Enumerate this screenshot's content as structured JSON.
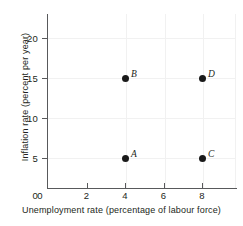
{
  "chart_data": {
    "type": "scatter",
    "title": "",
    "xlabel": "Unemployment rate (percentage of labour force)",
    "ylabel": "Inflation rate (percent per year)",
    "xlim": [
      0,
      9.8
    ],
    "ylim": [
      0,
      23
    ],
    "xticks": [
      0,
      2,
      4,
      6,
      8
    ],
    "xticklabels": [
      "0",
      "2",
      "4",
      "6",
      "8"
    ],
    "yticks": [
      0,
      5,
      10,
      15,
      20
    ],
    "yticklabels": [
      "0",
      "5",
      "10",
      "15",
      "20"
    ],
    "grid": true,
    "legend": "none",
    "points": [
      {
        "label": "A",
        "x": 4,
        "y": 5
      },
      {
        "label": "B",
        "x": 4,
        "y": 15
      },
      {
        "label": "C",
        "x": 8,
        "y": 5
      },
      {
        "label": "D",
        "x": 8,
        "y": 15
      }
    ],
    "marker_color": "#1a1a1a",
    "axis_color": "#58595b",
    "grid_color": "#f1f1f1",
    "background": "#ffffff"
  }
}
